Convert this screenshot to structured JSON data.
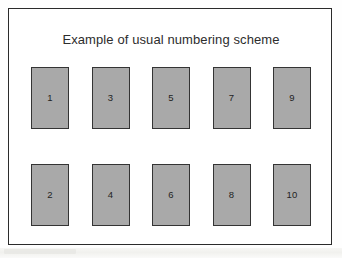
{
  "figure": {
    "title": "Example of usual numbering scheme",
    "background_color": "#ffffff",
    "frame_color": "#2b2b2b",
    "box_fill_color": "#a9a9a9",
    "box_border_color": "#343434",
    "label_color": "#232323"
  },
  "grid": {
    "columns": 5,
    "rows": 2,
    "ordering": "column-major",
    "rows_data": [
      {
        "name": "top-row",
        "cells": [
          {
            "label": "1"
          },
          {
            "label": "3"
          },
          {
            "label": "5"
          },
          {
            "label": "7"
          },
          {
            "label": "9"
          }
        ]
      },
      {
        "name": "bottom-row",
        "cells": [
          {
            "label": "2"
          },
          {
            "label": "4"
          },
          {
            "label": "6"
          },
          {
            "label": "8"
          },
          {
            "label": "10"
          }
        ]
      }
    ]
  }
}
